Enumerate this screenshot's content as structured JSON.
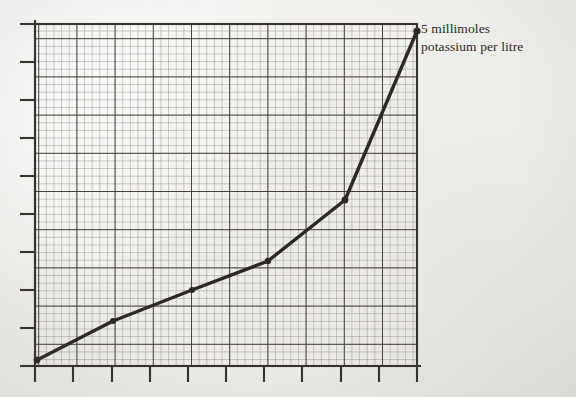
{
  "figure": {
    "media": "scanned graph paper",
    "background_color": "#f1f0ee",
    "ink_color": "#2b2825",
    "grid_minor_color": "#8e8b86",
    "grid_major_color": "#3a3734"
  },
  "annotation": {
    "line1": "5 millimoles",
    "line2": "potassium per litre"
  },
  "chart_data": {
    "type": "line",
    "title": "",
    "subtitle": "",
    "xlabel": "",
    "ylabel": "",
    "annotations": [
      {
        "text": "5 millimoles potassium per litre",
        "target_point_index": 5,
        "position": "right-of-endpoint"
      }
    ],
    "grid": {
      "visible": true,
      "minor_cells_x": 50,
      "minor_cells_y": 45,
      "major_every": 5,
      "minor_spacing_px": 7.64,
      "major_spacing_px": 38.2
    },
    "legend": {
      "visible": false,
      "position": "none"
    },
    "axes": {
      "x_tick_count": 11,
      "y_tick_count": 10,
      "x_tick_labels": [],
      "y_tick_labels": [],
      "xlim": [
        0,
        10
      ],
      "ylim": [
        0,
        9
      ]
    },
    "series": [
      {
        "name": "potassium concentration curve",
        "marker": "filled-circle",
        "line_width_px": 3.4,
        "x": [
          0.0,
          2.0,
          4.1,
          6.1,
          8.1,
          10.0
        ],
        "y": [
          0.18,
          1.21,
          2.02,
          2.77,
          4.37,
          8.82
        ],
        "points_px": [
          {
            "x": 37,
            "y": 360
          },
          {
            "x": 113,
            "y": 321
          },
          {
            "x": 192,
            "y": 290
          },
          {
            "x": 268,
            "y": 261
          },
          {
            "x": 345,
            "y": 200
          },
          {
            "x": 417,
            "y": 31
          }
        ]
      }
    ]
  }
}
